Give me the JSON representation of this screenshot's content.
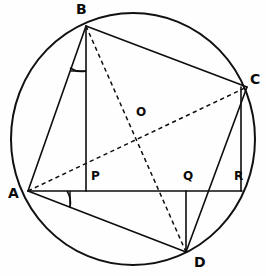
{
  "figure": {
    "type": "geometry-diagram",
    "canvas": {
      "width": 266,
      "height": 276
    },
    "background_color": "#fefefe",
    "ink_color": "#0d0d0d"
  },
  "circle": {
    "name": "circumcircle",
    "center": {
      "x": 133,
      "y": 139
    },
    "radius": 122,
    "stroke_color": "#111111"
  },
  "points": {
    "A": {
      "label": "A",
      "x": 28,
      "y": 191,
      "label_x": 8,
      "label_y": 187
    },
    "B": {
      "label": "B",
      "x": 86,
      "y": 26,
      "label_x": 76,
      "label_y": 2
    },
    "C": {
      "label": "C",
      "x": 247,
      "y": 87,
      "label_x": 250,
      "label_y": 72
    },
    "D": {
      "label": "D",
      "x": 186,
      "y": 252,
      "label_x": 194,
      "label_y": 256
    },
    "O": {
      "label": "O",
      "x": 134,
      "y": 137,
      "label_x": 136,
      "label_y": 106
    },
    "P": {
      "label": "P",
      "x": 86,
      "y": 191,
      "label_x": 91,
      "label_y": 170
    },
    "Q": {
      "label": "Q",
      "x": 186,
      "y": 191,
      "label_x": 184,
      "label_y": 170
    },
    "R": {
      "label": "R",
      "x": 240,
      "y": 191,
      "label_x": 234,
      "label_y": 170
    }
  },
  "segments": [
    {
      "name": "segment-AB",
      "from": "A",
      "to": "B",
      "style": "solid"
    },
    {
      "name": "segment-BC",
      "from": "B",
      "to": "C",
      "style": "solid"
    },
    {
      "name": "segment-CD",
      "from": "C",
      "to": "D",
      "style": "solid"
    },
    {
      "name": "segment-AD",
      "from": "A",
      "to": "D",
      "style": "solid"
    },
    {
      "name": "segment-AC-diagonal",
      "from": "A",
      "to": "C",
      "style": "dashed"
    },
    {
      "name": "segment-BD-diagonal",
      "from": "B",
      "to": "D",
      "style": "dashed"
    },
    {
      "name": "segment-AR-baseline",
      "from": "A",
      "to": "R",
      "style": "solid"
    },
    {
      "name": "segment-BP-perpendicular",
      "from": "B",
      "to": "P",
      "style": "solid"
    },
    {
      "name": "segment-QD-perpendicular",
      "from": "Q",
      "to": "D",
      "style": "solid"
    },
    {
      "name": "segment-CR-perpendicular",
      "from": "C",
      "to": "R",
      "style": "solid"
    }
  ],
  "angle_marks": [
    {
      "name": "angle-mark-at-B",
      "vertex": "B",
      "between": [
        "A",
        "P"
      ]
    },
    {
      "name": "angle-mark-at-A",
      "vertex": "A",
      "between": [
        "R",
        "D"
      ]
    }
  ],
  "labels_order": [
    "B",
    "C",
    "O",
    "A",
    "P",
    "Q",
    "R",
    "D"
  ]
}
